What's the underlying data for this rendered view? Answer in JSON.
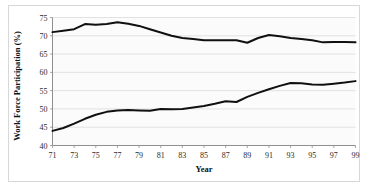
{
  "figure": {
    "background_color": "#ffffff",
    "frame_color": "#d8d8d8",
    "plot_background_color": "#fbfbfb",
    "gridline_color": "#d6d6d6",
    "axis_color": "#8f8f8f",
    "line_color": "#101010"
  },
  "chart_data": {
    "type": "line",
    "title": "",
    "xlabel": "Year",
    "ylabel": "Work Force Participation (%)",
    "xlim": [
      71,
      99
    ],
    "ylim": [
      40,
      75
    ],
    "ytick_labels": [
      "75",
      "70",
      "65",
      "60",
      "55",
      "50",
      "45",
      "40"
    ],
    "yticks": [
      75,
      70,
      65,
      60,
      55,
      50,
      45,
      40
    ],
    "xtick_labels": [
      "71",
      "73",
      "75",
      "77",
      "79",
      "81",
      "83",
      "85",
      "87",
      "89",
      "91",
      "93",
      "95",
      "97",
      "99"
    ],
    "xticks": [
      71,
      73,
      75,
      77,
      79,
      81,
      83,
      85,
      87,
      89,
      91,
      93,
      95,
      97,
      99
    ],
    "grid": true,
    "grid_axis": "y",
    "legend": "none",
    "x": [
      71,
      72,
      73,
      74,
      75,
      76,
      77,
      78,
      79,
      80,
      81,
      82,
      83,
      84,
      85,
      86,
      87,
      88,
      89,
      90,
      91,
      92,
      93,
      94,
      95,
      96,
      97,
      98,
      99
    ],
    "series": [
      {
        "name": "upper-line",
        "values": [
          71.0,
          71.4,
          71.8,
          73.2,
          73.0,
          73.2,
          73.7,
          73.3,
          72.7,
          71.8,
          70.9,
          70.0,
          69.4,
          69.1,
          68.8,
          68.8,
          68.8,
          68.8,
          68.1,
          69.4,
          70.2,
          69.9,
          69.4,
          69.1,
          68.8,
          68.2,
          68.3,
          68.3,
          68.2
        ]
      },
      {
        "name": "lower-line",
        "values": [
          44.0,
          44.8,
          46.0,
          47.3,
          48.4,
          49.2,
          49.6,
          49.7,
          49.6,
          49.5,
          50.0,
          49.9,
          50.0,
          50.4,
          50.8,
          51.4,
          52.1,
          51.9,
          53.3,
          54.4,
          55.4,
          56.3,
          57.1,
          57.0,
          56.7,
          56.6,
          56.9,
          57.2,
          57.6
        ]
      }
    ]
  }
}
